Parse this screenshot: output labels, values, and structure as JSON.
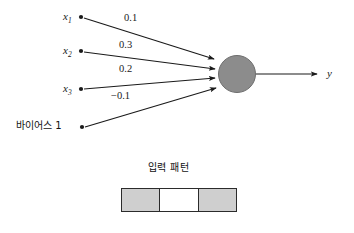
{
  "diagram": {
    "type": "neural-network-perceptron",
    "inputs": [
      {
        "id": "x1",
        "label": "x",
        "subscript": "1",
        "weight": "0.1"
      },
      {
        "id": "x2",
        "label": "x",
        "subscript": "2",
        "weight": "0.3"
      },
      {
        "id": "x3",
        "label": "x",
        "subscript": "3",
        "weight": "0.2"
      },
      {
        "id": "bias",
        "label": "바이어스 1",
        "weight": "−0.1"
      }
    ],
    "output": {
      "label": "y"
    },
    "neuron": {
      "fill_color": "#8c8c8c",
      "stroke_color": "#6d6d6d"
    },
    "line_color": "#1a1a1a"
  },
  "pattern": {
    "caption": "입력 패턴",
    "cells": [
      {
        "index": 0,
        "state": "filled",
        "color": "#cfcfcf"
      },
      {
        "index": 1,
        "state": "empty",
        "color": "#ffffff"
      },
      {
        "index": 2,
        "state": "filled",
        "color": "#cfcfcf"
      }
    ],
    "border_color": "#2b2b2b"
  }
}
